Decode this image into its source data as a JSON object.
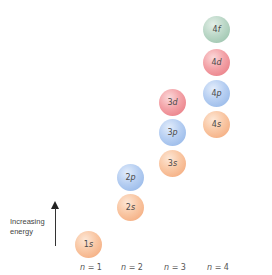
{
  "diagram": {
    "title": "",
    "energy_axis": {
      "label_line1": "Increasing",
      "label_line2": "energy",
      "direction": "up"
    },
    "shells": [
      {
        "n_symbol": "n",
        "n_value": "= 1"
      },
      {
        "n_symbol": "n",
        "n_value": "= 2"
      },
      {
        "n_symbol": "n",
        "n_value": "= 3"
      },
      {
        "n_symbol": "n",
        "n_value": "= 4"
      }
    ],
    "orbitals": [
      {
        "number": "1",
        "letter": "s",
        "shell": 1,
        "type": "s",
        "color": "#f3a474"
      },
      {
        "number": "2",
        "letter": "s",
        "shell": 2,
        "type": "s",
        "color": "#f3a474"
      },
      {
        "number": "2",
        "letter": "p",
        "shell": 2,
        "type": "p",
        "color": "#8db2e6"
      },
      {
        "number": "3",
        "letter": "s",
        "shell": 3,
        "type": "s",
        "color": "#f3a474"
      },
      {
        "number": "3",
        "letter": "p",
        "shell": 3,
        "type": "p",
        "color": "#8db2e6"
      },
      {
        "number": "3",
        "letter": "d",
        "shell": 3,
        "type": "d",
        "color": "#e7737c"
      },
      {
        "number": "4",
        "letter": "s",
        "shell": 4,
        "type": "s",
        "color": "#f3a474"
      },
      {
        "number": "4",
        "letter": "p",
        "shell": 4,
        "type": "p",
        "color": "#8db2e6"
      },
      {
        "number": "4",
        "letter": "d",
        "shell": 4,
        "type": "d",
        "color": "#e7737c"
      },
      {
        "number": "4",
        "letter": "f",
        "shell": 4,
        "type": "f",
        "color": "#93bfa6"
      }
    ],
    "colors": {
      "s": "#f3a474",
      "p": "#8db2e6",
      "d": "#e7737c",
      "f": "#93bfa6",
      "arrow": "#222222"
    }
  }
}
